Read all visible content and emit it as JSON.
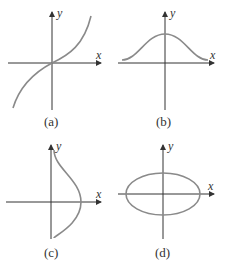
{
  "figure": {
    "panels": [
      {
        "id": "a",
        "caption": "(a)",
        "x_label": "x",
        "y_label": "y",
        "curve": "odd increasing S-curve through origin (cubic-like)"
      },
      {
        "id": "b",
        "caption": "(b)",
        "x_label": "x",
        "y_label": "y",
        "curve": "bell-shaped curve symmetric about y-axis"
      },
      {
        "id": "c",
        "caption": "(c)",
        "x_label": "x",
        "y_label": "y",
        "curve": "sideways bell curve symmetric about x-axis"
      },
      {
        "id": "d",
        "caption": "(d)",
        "x_label": "x",
        "y_label": "y",
        "curve": "ellipse centered at origin"
      }
    ],
    "colors": {
      "axis": "#333333",
      "curve": "#8a8a8a",
      "background": "#ffffff"
    }
  }
}
